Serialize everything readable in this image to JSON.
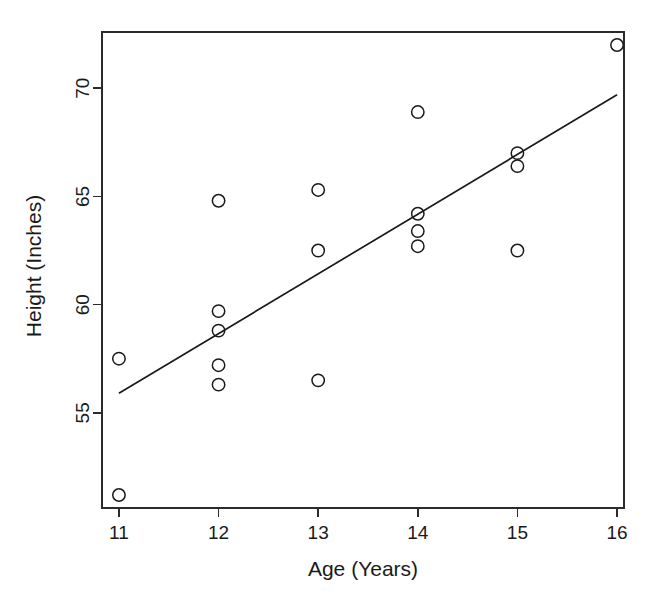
{
  "chart_data": {
    "type": "scatter",
    "title": "",
    "xlabel": "Age (Years)",
    "ylabel": "Height (Inches)",
    "xlim": [
      10.83,
      16.07
    ],
    "ylim": [
      50.6,
      72.6
    ],
    "xticks": [
      11,
      12,
      13,
      14,
      15,
      16
    ],
    "yticks": [
      55,
      60,
      65,
      70
    ],
    "xticklabels": [
      "11",
      "12",
      "13",
      "14",
      "15",
      "16"
    ],
    "yticklabels": [
      "55",
      "60",
      "65",
      "70"
    ],
    "grid": false,
    "legend": false,
    "marker": "open-circle",
    "x": [
      11,
      11,
      12,
      12,
      12,
      12,
      12,
      13,
      13,
      13,
      14,
      14,
      14,
      14,
      15,
      15,
      15,
      16
    ],
    "y": [
      57.5,
      51.2,
      64.8,
      59.7,
      58.8,
      57.2,
      56.3,
      65.3,
      62.5,
      56.5,
      68.9,
      64.2,
      63.4,
      62.7,
      67.0,
      66.4,
      62.5,
      72.0
    ],
    "points": [
      {
        "x": 11,
        "y": 57.5
      },
      {
        "x": 11,
        "y": 51.2
      },
      {
        "x": 12,
        "y": 64.8
      },
      {
        "x": 12,
        "y": 59.7
      },
      {
        "x": 12,
        "y": 58.8
      },
      {
        "x": 12,
        "y": 57.2
      },
      {
        "x": 12,
        "y": 56.3
      },
      {
        "x": 13,
        "y": 65.3
      },
      {
        "x": 13,
        "y": 62.5
      },
      {
        "x": 13,
        "y": 56.5
      },
      {
        "x": 14,
        "y": 68.9
      },
      {
        "x": 14,
        "y": 64.2
      },
      {
        "x": 14,
        "y": 63.4
      },
      {
        "x": 14,
        "y": 62.7
      },
      {
        "x": 15,
        "y": 67.0
      },
      {
        "x": 15,
        "y": 66.4
      },
      {
        "x": 15,
        "y": 62.5
      },
      {
        "x": 16,
        "y": 72.0
      }
    ],
    "trendline": {
      "name": "least-squares fit",
      "x": [
        11,
        16
      ],
      "y": [
        55.9,
        69.7
      ],
      "slope": 2.76,
      "intercept": 25.54
    },
    "colors": {
      "marker_stroke": "#1a1a1a",
      "line": "#1a1a1a",
      "axis": "#2b2b2b",
      "background": "#ffffff"
    }
  }
}
